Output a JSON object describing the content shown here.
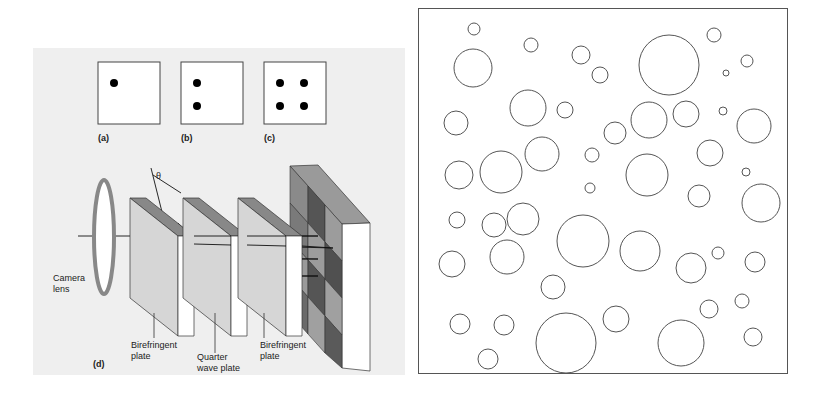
{
  "figure_left": {
    "subfigures": [
      {
        "id": "a",
        "label": "(a)",
        "dots": 1
      },
      {
        "id": "b",
        "label": "(b)",
        "dots": 2
      },
      {
        "id": "c",
        "label": "(c)",
        "dots": 4
      }
    ],
    "diagram_d": {
      "label": "(d)",
      "angle_symbol": "θ",
      "components": [
        {
          "name": "camera-lens",
          "label_line1": "Camera",
          "label_line2": "lens"
        },
        {
          "name": "birefringent-plate-1",
          "label_line1": "Birefringent",
          "label_line2": "plate"
        },
        {
          "name": "quarter-wave-plate",
          "label_line1": "Quarter",
          "label_line2": "wave plate"
        },
        {
          "name": "birefringent-plate-2",
          "label_line1": "Birefringent",
          "label_line2": "plate"
        },
        {
          "name": "sensor-grid",
          "label_line1": "",
          "label_line2": ""
        }
      ]
    }
  },
  "figure_right": {
    "description": "Circles of various sizes inside a square frame",
    "circles": [
      [
        473,
        28,
        6
      ],
      [
        530,
        44,
        7
      ],
      [
        580,
        54,
        9
      ],
      [
        599,
        74,
        8
      ],
      [
        472,
        67,
        19
      ],
      [
        668,
        64,
        30
      ],
      [
        713,
        34,
        7
      ],
      [
        746,
        60,
        6
      ],
      [
        725,
        72,
        3
      ],
      [
        527,
        107,
        18
      ],
      [
        564,
        109,
        8
      ],
      [
        614,
        132,
        11
      ],
      [
        648,
        119,
        18
      ],
      [
        685,
        113,
        13
      ],
      [
        722,
        110,
        4
      ],
      [
        753,
        125,
        17
      ],
      [
        455,
        122,
        12
      ],
      [
        541,
        153,
        17
      ],
      [
        591,
        154,
        7
      ],
      [
        646,
        174,
        21
      ],
      [
        709,
        152,
        13
      ],
      [
        745,
        171,
        4
      ],
      [
        589,
        187,
        5
      ],
      [
        458,
        174,
        14
      ],
      [
        500,
        171,
        21
      ],
      [
        522,
        218,
        16
      ],
      [
        456,
        219,
        8
      ],
      [
        493,
        224,
        12
      ],
      [
        582,
        240,
        26
      ],
      [
        639,
        250,
        20
      ],
      [
        698,
        195,
        11
      ],
      [
        760,
        202,
        19
      ],
      [
        717,
        252,
        6
      ],
      [
        690,
        267,
        15
      ],
      [
        754,
        261,
        10
      ],
      [
        451,
        263,
        13
      ],
      [
        506,
        256,
        17
      ],
      [
        552,
        286,
        12
      ],
      [
        459,
        323,
        10
      ],
      [
        503,
        324,
        10
      ],
      [
        565,
        342,
        30
      ],
      [
        615,
        318,
        13
      ],
      [
        680,
        342,
        23
      ],
      [
        708,
        308,
        9
      ],
      [
        741,
        300,
        7
      ],
      [
        752,
        336,
        9
      ],
      [
        487,
        358,
        10
      ]
    ]
  }
}
